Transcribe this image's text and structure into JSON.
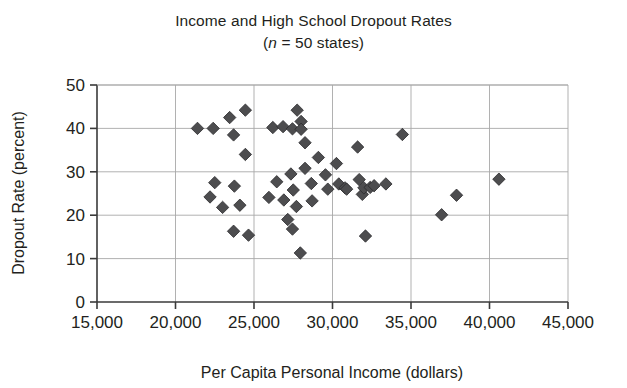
{
  "chart_data": {
    "type": "scatter",
    "title": "Income and High School Dropout Rates",
    "subtitle_prefix": "(",
    "subtitle_italic": "n",
    "subtitle_rest": " = 50 states)",
    "subtitle_full": "(n = 50 states)",
    "xlabel": "Per Capita Personal Income (dollars)",
    "ylabel": "Dropout Rate (percent)",
    "xlim": [
      15000,
      45000
    ],
    "ylim": [
      0,
      50
    ],
    "xticks": [
      15000,
      20000,
      25000,
      30000,
      35000,
      40000,
      45000
    ],
    "xtick_labels": [
      "15,000",
      "20,000",
      "25,000",
      "30,000",
      "35,000",
      "40,000",
      "45,000"
    ],
    "yticks": [
      0,
      10,
      20,
      30,
      40,
      50
    ],
    "ytick_labels": [
      "0",
      "10",
      "20",
      "30",
      "40",
      "50"
    ],
    "grid": "both",
    "legend": "none",
    "marker_shape": "diamond",
    "marker_color": "#4d4d4f",
    "n_points": 50,
    "points": [
      {
        "x": 21400,
        "y": 40.0
      },
      {
        "x": 22400,
        "y": 40.0
      },
      {
        "x": 23450,
        "y": 42.5
      },
      {
        "x": 24450,
        "y": 44.2
      },
      {
        "x": 23700,
        "y": 38.5
      },
      {
        "x": 24450,
        "y": 34.0
      },
      {
        "x": 22500,
        "y": 27.5
      },
      {
        "x": 23750,
        "y": 26.7
      },
      {
        "x": 22200,
        "y": 24.2
      },
      {
        "x": 23000,
        "y": 21.8
      },
      {
        "x": 24100,
        "y": 22.3
      },
      {
        "x": 23700,
        "y": 16.3
      },
      {
        "x": 24650,
        "y": 15.4
      },
      {
        "x": 26200,
        "y": 40.2
      },
      {
        "x": 26850,
        "y": 40.4
      },
      {
        "x": 27450,
        "y": 39.9
      },
      {
        "x": 27750,
        "y": 44.2
      },
      {
        "x": 28000,
        "y": 41.6
      },
      {
        "x": 28000,
        "y": 39.8
      },
      {
        "x": 28250,
        "y": 36.7
      },
      {
        "x": 25950,
        "y": 24.1
      },
      {
        "x": 26450,
        "y": 27.7
      },
      {
        "x": 26900,
        "y": 23.5
      },
      {
        "x": 27350,
        "y": 29.5
      },
      {
        "x": 27500,
        "y": 25.8
      },
      {
        "x": 27150,
        "y": 19.0
      },
      {
        "x": 27450,
        "y": 16.8
      },
      {
        "x": 27700,
        "y": 22.0
      },
      {
        "x": 27950,
        "y": 11.3
      },
      {
        "x": 28250,
        "y": 30.8
      },
      {
        "x": 28650,
        "y": 27.3
      },
      {
        "x": 28700,
        "y": 23.3
      },
      {
        "x": 29100,
        "y": 33.3
      },
      {
        "x": 29550,
        "y": 29.3
      },
      {
        "x": 29700,
        "y": 26.0
      },
      {
        "x": 30250,
        "y": 31.9
      },
      {
        "x": 30400,
        "y": 27.2
      },
      {
        "x": 30800,
        "y": 26.3
      },
      {
        "x": 30900,
        "y": 26.0
      },
      {
        "x": 31600,
        "y": 35.7
      },
      {
        "x": 31700,
        "y": 28.2
      },
      {
        "x": 31900,
        "y": 24.8
      },
      {
        "x": 32000,
        "y": 26.3
      },
      {
        "x": 32400,
        "y": 26.4
      },
      {
        "x": 32650,
        "y": 26.8
      },
      {
        "x": 32100,
        "y": 15.2
      },
      {
        "x": 33400,
        "y": 27.2
      },
      {
        "x": 34450,
        "y": 38.6
      },
      {
        "x": 36950,
        "y": 20.1
      },
      {
        "x": 37900,
        "y": 24.6
      },
      {
        "x": 40600,
        "y": 28.3
      }
    ]
  }
}
